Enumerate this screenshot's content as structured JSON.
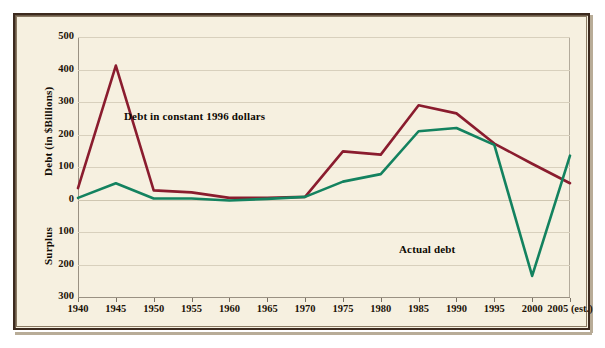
{
  "chart_data": {
    "type": "line",
    "title": "",
    "xlabel": "",
    "ylabel": "Debt (in $Billions)",
    "ylabel_lower": "Surplus",
    "grid": true,
    "legend_position": "inline-annotations",
    "categories": [
      "1940",
      "1945",
      "1950",
      "1955",
      "1960",
      "1965",
      "1970",
      "1975",
      "1980",
      "1985",
      "1990",
      "1995",
      "2000",
      "2005 (est.)"
    ],
    "x": [
      1940,
      1945,
      1950,
      1955,
      1960,
      1965,
      1970,
      1975,
      1980,
      1985,
      1990,
      1995,
      2000,
      2005
    ],
    "ylim": [
      -300,
      500
    ],
    "yticks": [
      500,
      400,
      300,
      200,
      100,
      0,
      -100,
      -200,
      -300
    ],
    "ytick_labels": [
      "500",
      "400",
      "300",
      "200",
      "100",
      "0",
      "100",
      "200",
      "300"
    ],
    "series": [
      {
        "name": "Debt in constant 1996 dollars",
        "color": "#8a1c2e",
        "values": [
          35,
          412,
          28,
          22,
          5,
          5,
          8,
          148,
          138,
          290,
          265,
          172,
          110,
          50
        ]
      },
      {
        "name": "Actual debt",
        "color": "#13825f",
        "values": [
          5,
          50,
          3,
          3,
          -3,
          2,
          8,
          55,
          78,
          210,
          220,
          168,
          -235,
          135
        ]
      }
    ],
    "annotations": [
      {
        "text": "Debt in constant 1996 dollars",
        "series": "Debt in constant 1996 dollars"
      },
      {
        "text": "Actual debt",
        "series": "Actual debt"
      }
    ]
  },
  "axis": {
    "y_title_upper": "Debt (in $Billions)",
    "y_title_lower": "Surplus",
    "y_ticks": [
      "500",
      "400",
      "300",
      "200",
      "100",
      "0",
      "100",
      "200",
      "300"
    ],
    "x_ticks": [
      "1940",
      "1945",
      "1950",
      "1955",
      "1960",
      "1965",
      "1970",
      "1975",
      "1980",
      "1985",
      "1990",
      "1995",
      "2000",
      "2005 (est.)"
    ]
  },
  "annotations": {
    "constant_dollars": "Debt in constant 1996 dollars",
    "actual_debt": "Actual debt"
  },
  "colors": {
    "background": "#f6f0e0",
    "frame": "#3c2a1e",
    "gridline": "#d8d0bd",
    "series_constant": "#8a1c2e",
    "series_actual": "#13825f",
    "text": "#1d1408"
  }
}
